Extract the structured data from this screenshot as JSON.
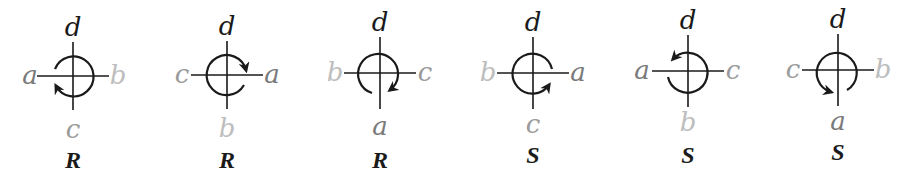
{
  "figure": {
    "colors": {
      "line": "#1a1a1a",
      "label_d": "#1a1a1a",
      "label_a": "#7a7a7a",
      "label_c": "#9a9a9a",
      "label_b": "#bdbdbd",
      "caption": "#1a1a1a"
    },
    "diagrams": [
      {
        "cx": 73,
        "cy": 76,
        "top": "d",
        "left": "a",
        "right": "b",
        "bottom": "c",
        "caption": "R",
        "rotation": "counterclockwise-arrow-at-lower-left"
      },
      {
        "cx": 227,
        "cy": 75,
        "top": "d",
        "left": "c",
        "right": "a",
        "bottom": "b",
        "caption": "R",
        "rotation": "arrow-at-upper-right"
      },
      {
        "cx": 380,
        "cy": 73,
        "top": "d",
        "left": "b",
        "right": "c",
        "bottom": "a",
        "caption": "R",
        "rotation": "arrow-at-lower-right"
      },
      {
        "cx": 533,
        "cy": 73,
        "top": "d",
        "left": "b",
        "right": "a",
        "bottom": "c",
        "caption": "S",
        "rotation": "arrow-at-lower-right"
      },
      {
        "cx": 688,
        "cy": 71,
        "top": "d",
        "left": "a",
        "right": "c",
        "bottom": "b",
        "caption": "S",
        "rotation": "arrow-at-upper-left"
      },
      {
        "cx": 838,
        "cy": 70,
        "top": "d",
        "left": "c",
        "right": "b",
        "bottom": "a",
        "caption": "S",
        "rotation": "arrow-at-lower-left"
      }
    ]
  }
}
